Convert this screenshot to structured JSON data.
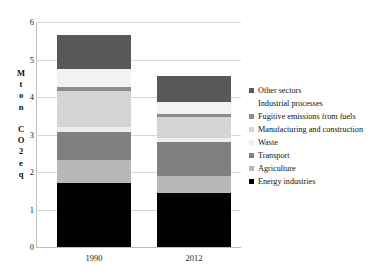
{
  "chart_data": {
    "type": "bar",
    "subtype": "stacked-bar",
    "title": "",
    "xlabel": "",
    "ylabel": "Mton CO2 eq",
    "categories": [
      "1990",
      "2012"
    ],
    "ylim": [
      0,
      6
    ],
    "ytick_labels": [
      "0",
      "1",
      "2",
      "3",
      "4",
      "5",
      "6"
    ],
    "ytick_values": [
      0,
      1,
      2,
      3,
      4,
      5,
      6
    ],
    "grid": true,
    "legend_position": "right",
    "stack_order_bottom_to_top": [
      "Energy industries",
      "Agriculture",
      "Transport",
      "Waste",
      "Manufacturing and construction",
      "Fugitive emissions from fuels",
      "Industrial processes",
      "Other sectors"
    ],
    "series": [
      {
        "name": "Other sectors",
        "color": "#585858",
        "values": [
          0.9,
          0.69
        ]
      },
      {
        "name": "Industrial processes",
        "color": "#f2f2f2",
        "values": [
          0.47,
          0.32
        ]
      },
      {
        "name": "Fugitive emissions from fuels",
        "color": "#8c8c8c",
        "values": [
          0.11,
          0.08
        ]
      },
      {
        "name": "Manufacturing and construction",
        "color": "#d4d4d4",
        "values": [
          0.97,
          0.54
        ]
      },
      {
        "name": "Waste",
        "color": "#ededed",
        "values": [
          0.12,
          0.12
        ]
      },
      {
        "name": "Transport",
        "color": "#808080",
        "values": [
          0.76,
          0.9
        ]
      },
      {
        "name": "Agriculture",
        "color": "#b8b8b8",
        "values": [
          0.62,
          0.46
        ]
      },
      {
        "name": "Energy industries",
        "color": "#000000",
        "values": [
          1.7,
          1.44
        ]
      }
    ],
    "totals": [
      5.65,
      4.55
    ]
  },
  "legend": {
    "entries": [
      {
        "label": "Other sectors",
        "color": "#585858"
      },
      {
        "label": "Industrial processes",
        "color": "#ffffff"
      },
      {
        "label": "Fugitive emissions from fuels",
        "color": "#8c8c8c"
      },
      {
        "label": "Manufacturing and construction",
        "color": "#d4d4d4"
      },
      {
        "label": "Waste",
        "color": "#ededed"
      },
      {
        "label": "Transport",
        "color": "#808080"
      },
      {
        "label": "Agriculture",
        "color": "#b8b8b8"
      },
      {
        "label": "Energy industries",
        "color": "#000000"
      }
    ]
  },
  "axis": {
    "y_title_chars": [
      "M",
      "t",
      "o",
      "n",
      " ",
      "C",
      "O",
      "2",
      "e",
      "q"
    ]
  }
}
